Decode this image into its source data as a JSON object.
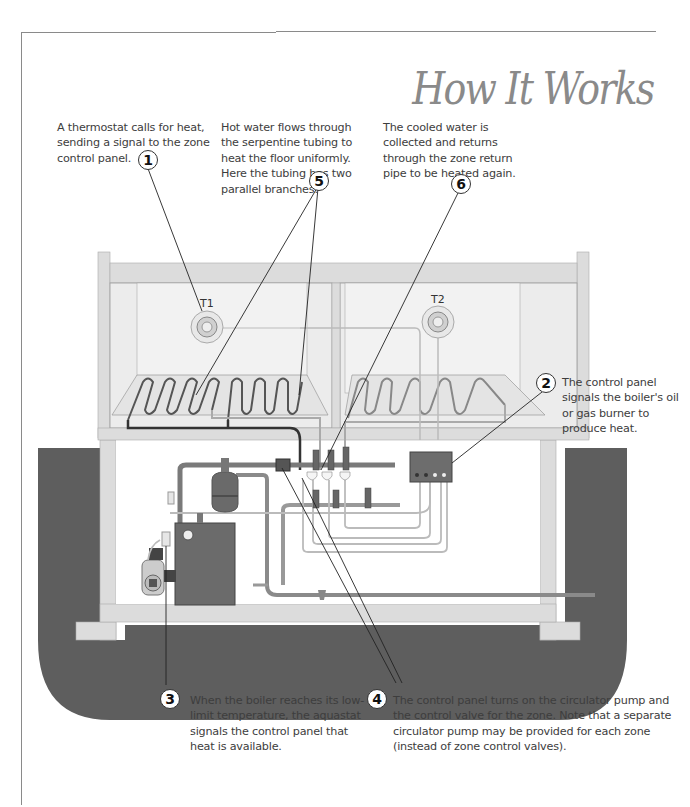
{
  "page": {
    "title": "How It Works"
  },
  "labels": {
    "thermostat_1": "T1",
    "thermostat_2": "T2"
  },
  "steps": [
    {
      "number": "1",
      "text": "A thermostat calls for heat, sending a signal to the zone control panel."
    },
    {
      "number": "2",
      "text": "The control panel signals the boiler's oil or gas burner to produce heat."
    },
    {
      "number": "3",
      "text": "When the boiler reaches its low-limit temperature, the aquastat signals the control panel that heat is available."
    },
    {
      "number": "4",
      "text": "The control panel turns on the circulator pump and the control valve for the zone. Note that a separate circulator pump may be provided for each zone (instead of zone control valves)."
    },
    {
      "number": "5",
      "text": "Hot water flows through the serpentine tubing to heat the floor uniformly. Here the tubing has two parallel branches."
    },
    {
      "number": "6",
      "text": "The cooled water is collected and returns through the zone return pipe to be heated again."
    }
  ],
  "colors": {
    "ground": "#5e5e5e",
    "wall": "#dcdcdc",
    "room_fill": "#ececec",
    "boiler": "#6b6b6b",
    "pipe_dark": "#4a4a4a",
    "pipe_light": "#bdbdbd",
    "title": "#8a8a8a"
  }
}
